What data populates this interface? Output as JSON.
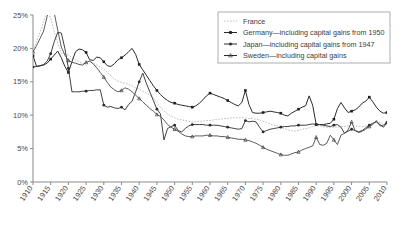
{
  "chart_data": {
    "type": "line",
    "title": "",
    "subtitle": "",
    "xlabel": "",
    "ylabel": "",
    "xlim": [
      1910,
      2010
    ],
    "ylim": [
      0,
      25
    ],
    "grid": false,
    "legend_position": "top-right",
    "x_tick_labels": [
      "1910",
      "1915",
      "1920",
      "1925",
      "1930",
      "1935",
      "1940",
      "1945",
      "1950",
      "1955",
      "1960",
      "1965",
      "1970",
      "1975",
      "1980",
      "1985",
      "1990",
      "1995",
      "2000",
      "2005",
      "2010"
    ],
    "y_tick_labels": [
      "0%",
      "5%",
      "10%",
      "15%",
      "20%",
      "25%"
    ],
    "y_tick_values": [
      0,
      5,
      10,
      15,
      20,
      25
    ],
    "series": [
      {
        "name": "France",
        "marker": "none",
        "style": "dotted-light-gray",
        "color": "#bdbdbd",
        "x": [
          1910,
          1911,
          1912,
          1913,
          1914,
          1915,
          1916,
          1917,
          1918,
          1919,
          1920,
          1921,
          1922,
          1923,
          1924,
          1925,
          1926,
          1927,
          1928,
          1929,
          1930,
          1931,
          1932,
          1933,
          1934,
          1935,
          1936,
          1937,
          1938,
          1939,
          1940,
          1941,
          1942,
          1943,
          1944,
          1945,
          1946,
          1947,
          1948,
          1949,
          1950,
          1951,
          1952,
          1953,
          1954,
          1955,
          1956,
          1957,
          1958,
          1959,
          1960,
          1961,
          1962,
          1963,
          1964,
          1965,
          1966,
          1967,
          1968,
          1969,
          1970,
          1971,
          1972,
          1973,
          1974,
          1975,
          1976,
          1977,
          1978,
          1979,
          1980,
          1981,
          1982,
          1983,
          1984,
          1985,
          1986,
          1987,
          1988,
          1989,
          1990,
          1991,
          1992,
          1993,
          1994,
          1995,
          1996,
          1997,
          1998,
          1999,
          2000,
          2001,
          2002,
          2003,
          2004,
          2005,
          2006,
          2007,
          2008,
          2009,
          2010
        ],
        "y": [
          19.6,
          21.0,
          22.5,
          24.0,
          25.6,
          24.5,
          22.5,
          20.8,
          19.3,
          19.1,
          19.0,
          18.6,
          18.3,
          18.0,
          17.7,
          17.9,
          18.1,
          17.8,
          17.5,
          17.2,
          16.9,
          16.4,
          15.9,
          15.4,
          15.1,
          14.9,
          14.8,
          14.6,
          14.4,
          14.1,
          13.9,
          13.6,
          13.3,
          13.0,
          12.6,
          11.9,
          11.2,
          10.6,
          10.2,
          9.9,
          9.6,
          9.4,
          9.3,
          9.2,
          9.1,
          9.0,
          9.0,
          9.1,
          9.1,
          9.2,
          9.2,
          9.3,
          9.4,
          9.4,
          9.5,
          9.5,
          9.6,
          9.6,
          9.6,
          9.6,
          9.6,
          9.5,
          9.5,
          9.4,
          9.3,
          9.1,
          8.9,
          8.7,
          8.5,
          8.4,
          8.2,
          8.0,
          7.8,
          7.7,
          7.6,
          7.7,
          7.9,
          8.0,
          8.1,
          8.3,
          8.4,
          8.4,
          8.3,
          8.2,
          8.2,
          8.2,
          8.2,
          8.3,
          8.3,
          8.4,
          8.5,
          8.4,
          8.3,
          8.3,
          8.4,
          8.6,
          8.8,
          9.0,
          8.9,
          8.6,
          8.9
        ]
      },
      {
        "name": "Germany—including capital gains from 1950",
        "marker": "square-filled",
        "style": "solid-dark",
        "color": "#1f1f1f",
        "x": [
          1910,
          1911,
          1912,
          1913,
          1914,
          1915,
          1916,
          1917,
          1918,
          1919,
          1920,
          1921,
          1922,
          1923,
          1924,
          1925,
          1926,
          1927,
          1928,
          1929,
          1930,
          1931,
          1932,
          1933,
          1934,
          1935,
          1936,
          1937,
          1938,
          1939,
          1940,
          1941,
          1942,
          1943,
          1944,
          1945,
          1946,
          1947,
          1948,
          1949,
          1950,
          1951,
          1952,
          1953,
          1954,
          1955,
          1956,
          1957,
          1958,
          1959,
          1960,
          1961,
          1962,
          1963,
          1964,
          1965,
          1966,
          1967,
          1968,
          1969,
          1970,
          1971,
          1972,
          1973,
          1974,
          1975,
          1976,
          1977,
          1978,
          1979,
          1980,
          1981,
          1982,
          1983,
          1984,
          1985,
          1986,
          1987,
          1988,
          1989,
          1990,
          1991,
          1992,
          1993,
          1994,
          1995,
          1996,
          1997,
          1998,
          1999,
          2000,
          2001,
          2002,
          2003,
          2004,
          2005,
          2006,
          2007,
          2008,
          2009,
          2010
        ],
        "y": [
          18.9,
          17.3,
          17.4,
          17.5,
          17.8,
          18.4,
          19.0,
          19.6,
          18.6,
          17.3,
          16.4,
          18.0,
          19.5,
          19.9,
          19.8,
          19.4,
          18.3,
          18.2,
          18.7,
          18.6,
          18.0,
          17.4,
          17.3,
          17.7,
          18.3,
          18.6,
          19.0,
          19.5,
          20.0,
          19.1,
          17.6,
          16.8,
          16.0,
          15.2,
          14.4,
          13.7,
          13.1,
          12.6,
          12.2,
          11.9,
          11.8,
          11.6,
          11.5,
          11.4,
          11.3,
          11.2,
          11.4,
          11.8,
          12.3,
          12.9,
          13.3,
          13.1,
          12.9,
          12.7,
          12.5,
          12.2,
          11.9,
          11.6,
          11.4,
          11.9,
          13.7,
          11.6,
          10.4,
          10.3,
          10.3,
          10.4,
          10.5,
          10.6,
          10.5,
          10.4,
          10.3,
          10.0,
          9.9,
          10.3,
          10.6,
          10.9,
          11.2,
          11.4,
          12.9,
          11.5,
          8.6,
          8.6,
          8.6,
          8.7,
          8.8,
          9.4,
          11.0,
          11.9,
          11.1,
          10.4,
          10.6,
          10.8,
          11.2,
          11.8,
          12.1,
          12.7,
          12.0,
          11.2,
          10.6,
          10.3,
          10.4
        ]
      },
      {
        "name": "Japan—including capital gains from 1947",
        "marker": "dot-filled",
        "style": "solid-dark-thin",
        "color": "#2b2b2b",
        "x": [
          1910,
          1911,
          1912,
          1913,
          1914,
          1915,
          1916,
          1917,
          1918,
          1919,
          1920,
          1921,
          1922,
          1923,
          1924,
          1925,
          1926,
          1927,
          1928,
          1929,
          1930,
          1931,
          1932,
          1933,
          1934,
          1935,
          1936,
          1937,
          1938,
          1939,
          1940,
          1941,
          1942,
          1943,
          1944,
          1945,
          1946,
          1947,
          1948,
          1949,
          1950,
          1951,
          1952,
          1953,
          1954,
          1955,
          1956,
          1957,
          1958,
          1959,
          1960,
          1961,
          1962,
          1963,
          1964,
          1965,
          1966,
          1967,
          1968,
          1969,
          1970,
          1971,
          1972,
          1973,
          1974,
          1975,
          1976,
          1977,
          1978,
          1979,
          1980,
          1981,
          1982,
          1983,
          1984,
          1985,
          1986,
          1987,
          1988,
          1989,
          1990,
          1991,
          1992,
          1993,
          1994,
          1995,
          1996,
          1997,
          1998,
          1999,
          2000,
          2001,
          2002,
          2003,
          2004,
          2005,
          2006,
          2007,
          2008,
          2009,
          2010
        ],
        "y": [
          17.2,
          17.3,
          17.4,
          17.6,
          18.1,
          19.2,
          21.0,
          22.4,
          22.3,
          20.0,
          17.0,
          13.5,
          13.5,
          13.5,
          13.6,
          13.6,
          13.7,
          13.7,
          13.8,
          13.8,
          11.5,
          11.2,
          11.3,
          11.1,
          11.0,
          11.2,
          10.8,
          11.6,
          12.1,
          13.5,
          15.0,
          16.3,
          14.8,
          13.5,
          12.2,
          10.9,
          10.2,
          6.3,
          8.0,
          8.3,
          8.5,
          7.7,
          7.5,
          8.0,
          8.4,
          8.6,
          8.6,
          8.6,
          8.6,
          8.5,
          8.5,
          8.5,
          8.5,
          8.4,
          8.3,
          8.2,
          8.1,
          8.0,
          7.9,
          8.0,
          9.2,
          9.0,
          9.1,
          9.0,
          8.2,
          7.5,
          7.7,
          7.9,
          8.0,
          8.1,
          8.2,
          8.3,
          8.3,
          8.4,
          8.4,
          8.5,
          8.5,
          8.5,
          8.6,
          8.7,
          8.6,
          8.6,
          8.5,
          8.4,
          8.3,
          8.5,
          8.6,
          8.2,
          7.3,
          7.6,
          7.9,
          7.7,
          7.5,
          7.7,
          8.1,
          8.5,
          8.8,
          9.0,
          8.6,
          8.2,
          8.9
        ]
      },
      {
        "name": "Sweden—including capital gains",
        "marker": "triangle-open",
        "style": "solid-gray",
        "color": "#3a3a3a",
        "x": [
          1910,
          1911,
          1912,
          1913,
          1914,
          1915,
          1916,
          1917,
          1918,
          1919,
          1920,
          1921,
          1922,
          1923,
          1924,
          1925,
          1926,
          1927,
          1928,
          1929,
          1930,
          1931,
          1932,
          1933,
          1934,
          1935,
          1936,
          1937,
          1938,
          1939,
          1940,
          1941,
          1942,
          1943,
          1944,
          1945,
          1946,
          1947,
          1948,
          1949,
          1950,
          1951,
          1952,
          1953,
          1954,
          1955,
          1956,
          1957,
          1958,
          1959,
          1960,
          1961,
          1962,
          1963,
          1964,
          1965,
          1966,
          1967,
          1968,
          1969,
          1970,
          1971,
          1972,
          1973,
          1974,
          1975,
          1976,
          1977,
          1978,
          1979,
          1980,
          1981,
          1982,
          1983,
          1984,
          1985,
          1986,
          1987,
          1988,
          1989,
          1990,
          1991,
          1992,
          1993,
          1994,
          1995,
          1996,
          1997,
          1998,
          1999,
          2000,
          2001,
          2002,
          2003,
          2004,
          2005,
          2006,
          2007,
          2008,
          2009,
          2010
        ],
        "y": [
          19.5,
          20.4,
          21.5,
          22.6,
          24.8,
          26.5,
          25.3,
          22.7,
          20.2,
          19.0,
          18.2,
          17.9,
          17.8,
          17.6,
          17.5,
          17.9,
          18.1,
          17.7,
          17.1,
          16.4,
          15.7,
          14.9,
          14.2,
          13.8,
          13.5,
          13.7,
          14.1,
          13.9,
          13.5,
          13.0,
          12.5,
          12.0,
          11.5,
          11.0,
          10.6,
          10.1,
          9.8,
          9.3,
          8.6,
          8.2,
          7.9,
          7.6,
          7.2,
          6.9,
          6.8,
          6.8,
          6.9,
          6.9,
          6.9,
          7.0,
          7.0,
          6.9,
          6.9,
          6.8,
          6.8,
          6.7,
          6.6,
          6.5,
          6.4,
          6.4,
          6.3,
          6.2,
          6.0,
          5.8,
          5.5,
          5.2,
          4.9,
          4.7,
          4.5,
          4.3,
          4.1,
          4.0,
          4.0,
          4.2,
          4.4,
          4.5,
          4.8,
          5.0,
          5.2,
          5.4,
          6.7,
          5.6,
          5.5,
          5.8,
          7.0,
          6.3,
          5.6,
          7.0,
          7.3,
          7.8,
          9.0,
          7.7,
          7.4,
          7.6,
          7.9,
          8.3,
          8.6,
          9.2,
          8.4,
          8.5,
          8.9
        ]
      }
    ]
  },
  "legend": {
    "entries": [
      {
        "label": "France",
        "marker": "none-light-dotted"
      },
      {
        "label": "Germany—including capital gains from 1950",
        "marker": "square-filled"
      },
      {
        "label": "Japan—including capital gains from 1947",
        "marker": "dot-filled"
      },
      {
        "label": "Sweden—including capital gains",
        "marker": "triangle-open"
      }
    ]
  }
}
